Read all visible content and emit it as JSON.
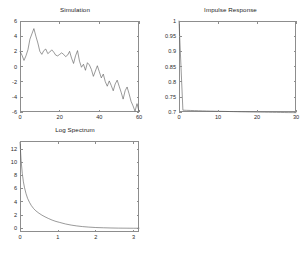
{
  "figure": {
    "background": "#ffffff",
    "axis_color": "#8d8d8d",
    "line_color": "#555555",
    "text_color": "#2b2b2b"
  },
  "chart_data": [
    {
      "type": "line",
      "title": "Simulation",
      "xlabel": "",
      "ylabel": "",
      "xlim": [
        0,
        60
      ],
      "ylim": [
        -6,
        6
      ],
      "xticks": [
        0,
        20,
        40,
        60
      ],
      "yticks": [
        -6,
        -4,
        -2,
        0,
        2,
        4,
        6
      ],
      "xtick_labels": [
        "0",
        "20",
        "40",
        "60"
      ],
      "ytick_labels": [
        "-6",
        "-4",
        "-2",
        "0",
        "2",
        "4",
        "6"
      ],
      "grid": false,
      "legend": "none",
      "x": [
        0,
        1,
        2,
        3,
        4,
        5,
        6,
        7,
        8,
        9,
        10,
        11,
        12,
        13,
        14,
        15,
        16,
        17,
        18,
        19,
        20,
        21,
        22,
        23,
        24,
        25,
        26,
        27,
        28,
        29,
        30,
        31,
        32,
        33,
        34,
        35,
        36,
        37,
        38,
        39,
        40,
        41,
        42,
        43,
        44,
        45,
        46,
        47,
        48,
        49,
        50,
        51,
        52,
        53,
        54,
        55,
        56,
        57,
        58,
        59,
        60
      ],
      "values": [
        2.0,
        1.5,
        0.8,
        1.4,
        2.2,
        3.6,
        4.3,
        5.0,
        4.0,
        3.1,
        2.0,
        1.6,
        2.1,
        2.3,
        1.7,
        1.9,
        2.2,
        1.9,
        1.5,
        1.4,
        1.6,
        1.8,
        1.6,
        1.3,
        1.5,
        2.0,
        1.1,
        0.4,
        1.4,
        2.1,
        0.7,
        -0.1,
        0.3,
        -0.5,
        0.5,
        0.2,
        -0.4,
        -1.3,
        -0.6,
        0.1,
        -0.7,
        -1.5,
        -1.0,
        -2.0,
        -2.6,
        -1.9,
        -2.5,
        -3.2,
        -2.3,
        -1.8,
        -2.6,
        -3.4,
        -4.3,
        -3.2,
        -2.7,
        -3.6,
        -4.6,
        -5.2,
        -5.9,
        -4.9,
        -5.9
      ]
    },
    {
      "type": "line",
      "title": "Impulse Response",
      "xlabel": "",
      "ylabel": "",
      "xlim": [
        0,
        30
      ],
      "ylim": [
        0.7,
        1.0
      ],
      "xticks": [
        0,
        10,
        20,
        30
      ],
      "yticks": [
        0.7,
        0.75,
        0.8,
        0.85,
        0.9,
        0.95,
        1
      ],
      "xtick_labels": [
        "0",
        "10",
        "20",
        "30"
      ],
      "ytick_labels": [
        "0.7",
        "0.75",
        "0.8",
        "0.85",
        "0.9",
        "0.95",
        "1"
      ],
      "grid": false,
      "legend": "none",
      "x": [
        0,
        1,
        2,
        3,
        4,
        5,
        6,
        7,
        8,
        9,
        10,
        11,
        12,
        13,
        14,
        15,
        16,
        17,
        18,
        19,
        20,
        21,
        22,
        23,
        24,
        25,
        26,
        27,
        28,
        29,
        30
      ],
      "values": [
        1.0,
        0.706,
        0.7055,
        0.705,
        0.7046,
        0.7042,
        0.7038,
        0.7034,
        0.703,
        0.7027,
        0.7024,
        0.7021,
        0.7018,
        0.7015,
        0.7012,
        0.7009,
        0.7006,
        0.7004,
        0.7001,
        0.6999,
        0.6997,
        0.6995,
        0.6993,
        0.6991,
        0.6989,
        0.6987,
        0.6985,
        0.6983,
        0.6981,
        0.698,
        0.6978
      ]
    },
    {
      "type": "line",
      "title": "Log Spectrum",
      "xlabel": "",
      "ylabel": "",
      "xlim": [
        0,
        3.1416
      ],
      "ylim": [
        -0.6,
        13.2
      ],
      "xticks": [
        0,
        1,
        2,
        3
      ],
      "yticks": [
        0,
        2,
        4,
        6,
        8,
        10,
        12
      ],
      "xtick_labels": [
        "0",
        "1",
        "2",
        "3"
      ],
      "ytick_labels": [
        "0",
        "2",
        "4",
        "6",
        "8",
        "10",
        "12"
      ],
      "grid": false,
      "legend": "none",
      "x": [
        0.0,
        0.03,
        0.06,
        0.09,
        0.12,
        0.16,
        0.2,
        0.25,
        0.3,
        0.36,
        0.42,
        0.5,
        0.58,
        0.66,
        0.75,
        0.85,
        0.95,
        1.05,
        1.2,
        1.35,
        1.5,
        1.65,
        1.8,
        2.0,
        2.2,
        2.4,
        2.6,
        2.8,
        3.0,
        3.1416
      ],
      "values": [
        13.0,
        10.2,
        8.3,
        7.0,
        6.1,
        5.2,
        4.5,
        3.9,
        3.4,
        2.95,
        2.6,
        2.25,
        1.95,
        1.7,
        1.45,
        1.2,
        1.0,
        0.85,
        0.62,
        0.45,
        0.32,
        0.22,
        0.15,
        0.08,
        0.04,
        0.01,
        -0.01,
        -0.02,
        -0.03,
        -0.03
      ]
    }
  ]
}
